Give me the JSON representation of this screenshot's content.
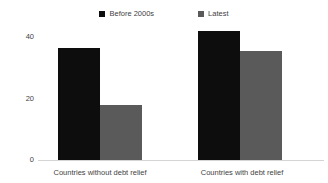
{
  "chart_data": {
    "type": "bar",
    "title": "",
    "xlabel": "",
    "ylabel": "",
    "categories": [
      "Countries without debt relief",
      "Countries with debt relief"
    ],
    "series": [
      {
        "name": "Before 2000s",
        "color": "#0d0d0d",
        "values": [
          36.5,
          42
        ]
      },
      {
        "name": "Latest",
        "color": "#5a5a5a",
        "values": [
          18,
          35.5
        ]
      }
    ],
    "yticks": [
      "0",
      "20",
      "40"
    ],
    "ylim": [
      0,
      44
    ],
    "grid": false,
    "legend_position": "top-center"
  },
  "legend": {
    "items": [
      {
        "label": "Before 2000s",
        "swatch": "legend-swatch-before-2000s"
      },
      {
        "label": "Latest",
        "swatch": "legend-swatch-latest"
      }
    ]
  },
  "axis": {
    "y": {
      "tick_40": "40",
      "tick_20": "20",
      "tick_0": "0"
    },
    "x": {
      "cat_1": "Countries without debt relief",
      "cat_2": "Countries with debt relief"
    }
  }
}
